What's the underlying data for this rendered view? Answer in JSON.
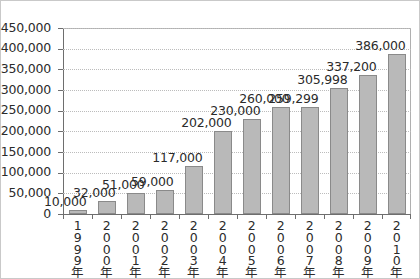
{
  "chart_data": {
    "type": "bar",
    "title": "",
    "subtitle": "",
    "xlabel": "",
    "ylabel": "",
    "categories": [
      "1999年",
      "2000年",
      "2001年",
      "2002年",
      "2003年",
      "2004年",
      "2005年",
      "2006年",
      "2007年",
      "2008年",
      "2009年",
      "2010年"
    ],
    "values": [
      10000,
      32000,
      51000,
      59000,
      117000,
      202000,
      230000,
      260000,
      259299,
      305998,
      337200,
      386000
    ],
    "data_labels": [
      "10,000",
      "32,000",
      "51,000",
      "59,000",
      "117,000",
      "202,000",
      "230,000",
      "260,000",
      "259,299",
      "305,998",
      "337,200",
      "386,000"
    ],
    "ytick_labels": [
      "450,000",
      "400,000",
      "350,000",
      "300,000",
      "250,000",
      "200,000",
      "150,000",
      "100,000",
      "50,000",
      "0"
    ],
    "ytick_values": [
      450000,
      400000,
      350000,
      300000,
      250000,
      200000,
      150000,
      100000,
      50000,
      0
    ],
    "ylim": [
      0,
      450000
    ],
    "grid": true,
    "legend": false,
    "legend_position": "none",
    "colors": {
      "bar_fill": "#b9b9b9",
      "bar_border": "#8a8a8a",
      "gridline": "#bcbcbc",
      "axis": "#6e6e6e",
      "text": "#2b2b2b",
      "frame": "#c9c9c9",
      "background": "#ffffff"
    }
  }
}
